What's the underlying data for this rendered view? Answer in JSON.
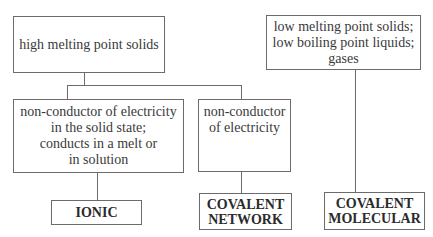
{
  "diagram": {
    "type": "classification-flowchart",
    "nodes": {
      "high_mp": {
        "text": "high melting point solids"
      },
      "low_mp": {
        "text": "low melting point solids;\nlow boiling point liquids;\ngases"
      },
      "ionic_prop": {
        "text": "non-conductor of electricity\nin the solid state;\nconducts in a melt or\nin solution"
      },
      "network_prop": {
        "text": "non-conductor\nof electricity"
      },
      "ionic": {
        "text": "IONIC"
      },
      "covalent_network": {
        "text": "COVALENT\nNETWORK"
      },
      "covalent_molecular": {
        "text": "COVALENT\nMOLECULAR"
      }
    },
    "edges": [
      {
        "from": "high_mp",
        "to": "ionic_prop"
      },
      {
        "from": "high_mp",
        "to": "network_prop"
      },
      {
        "from": "ionic_prop",
        "to": "ionic"
      },
      {
        "from": "network_prop",
        "to": "covalent_network"
      },
      {
        "from": "low_mp",
        "to": "covalent_molecular"
      }
    ],
    "colors": {
      "border": "#6b6b6b",
      "text": "#3a3a3a",
      "background": "#ffffff"
    }
  }
}
